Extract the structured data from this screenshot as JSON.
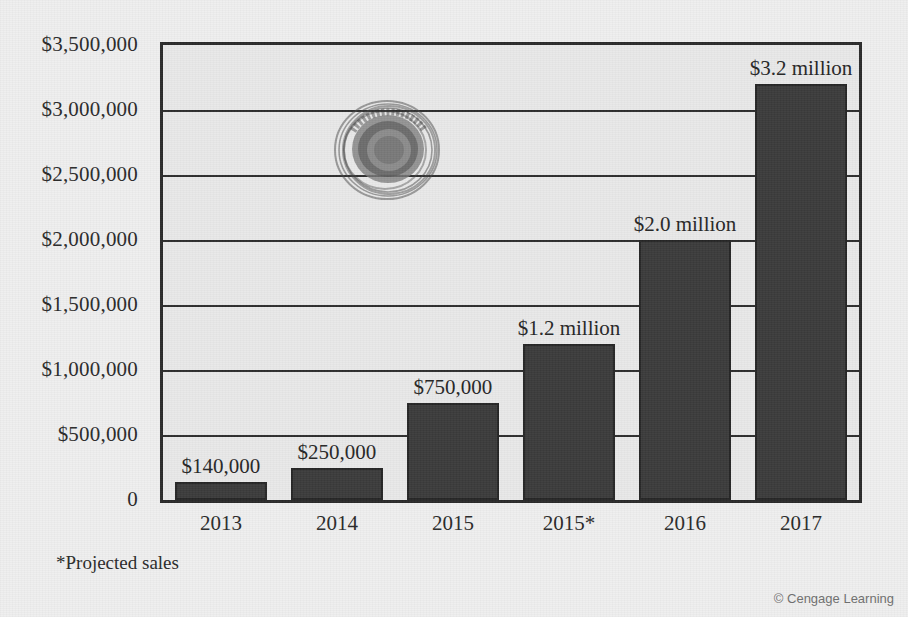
{
  "figure": {
    "footnote": "*Projected sales",
    "credit": "© Cengage Learning",
    "logo_alt": "circular-emblem-watermark"
  },
  "colors": {
    "bar_fill": "#3b3b3b",
    "bar_stroke": "#262626",
    "plot_background": "#e9e9e9",
    "page_background": "#efefef",
    "axis": "#2b2b2b",
    "text": "#2a2a2a",
    "credit_text": "#6f6f6f"
  },
  "chart_data": {
    "type": "bar",
    "title": "",
    "subtitle": "",
    "xlabel": "",
    "ylabel": "",
    "categories": [
      "2013",
      "2014",
      "2015",
      "2015*",
      "2016",
      "2017"
    ],
    "values": [
      140000,
      250000,
      750000,
      1200000,
      2000000,
      3200000
    ],
    "data_labels": [
      "$140,000",
      "$250,000",
      "$750,000",
      "$1.2 million",
      "$2.0 million",
      "$3.2 million"
    ],
    "ylim": [
      0,
      3500000
    ],
    "ytick_values": [
      0,
      500000,
      1000000,
      1500000,
      2000000,
      2500000,
      3000000,
      3500000
    ],
    "ytick_labels": [
      "0",
      "$500,000",
      "$1,000,000",
      "$1,500,000",
      "$2,000,000",
      "$2,500,000",
      "$3,000,000",
      "$3,500,000"
    ],
    "grid": true,
    "grid_axis": "y",
    "legend": false,
    "legend_position": "none",
    "annotations": [
      "*Projected sales"
    ],
    "series": [
      {
        "name": "Sales",
        "values": [
          140000,
          250000,
          750000,
          1200000,
          2000000,
          3200000
        ]
      }
    ]
  }
}
